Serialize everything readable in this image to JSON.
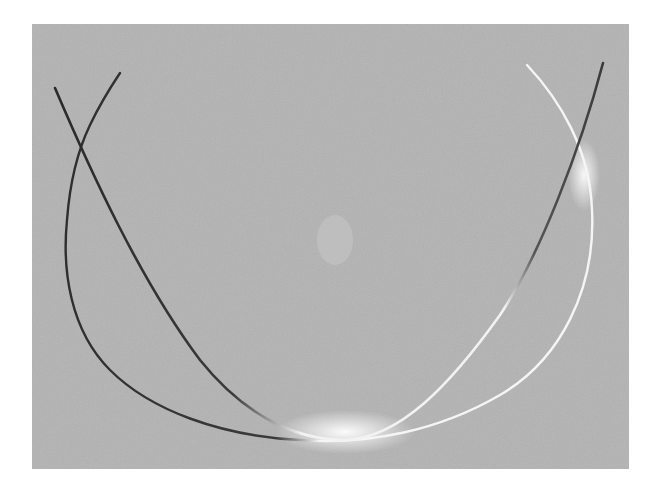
{
  "image": {
    "description": "Grayscale photograph of two crossing curved lines forming a U / elliptical arc pattern (diffraction-style lines), dark on upper left, bright where they meet near the bottom",
    "background_color": "#ffffff",
    "plate_color": "#b3b3b3",
    "dark_line_color": "#2e2e2e",
    "bright_line_color": "#f4f4f4",
    "curves": [
      {
        "name": "steep-curve",
        "points": [
          [
            55,
            88
          ],
          [
            80,
            148
          ],
          [
            150,
            290
          ],
          [
            230,
            390
          ],
          [
            300,
            430
          ],
          [
            350,
            440
          ],
          [
            420,
            410
          ],
          [
            500,
            320
          ],
          [
            560,
            200
          ],
          [
            603,
            63
          ]
        ]
      },
      {
        "name": "u-arc",
        "points": [
          [
            120,
            73
          ],
          [
            80,
            148
          ],
          [
            67,
            260
          ],
          [
            90,
            350
          ],
          [
            150,
            410
          ],
          [
            240,
            436
          ],
          [
            330,
            442
          ],
          [
            420,
            425
          ],
          [
            520,
            370
          ],
          [
            588,
            260
          ],
          [
            592,
            180
          ],
          [
            575,
            130
          ],
          [
            527,
            65
          ]
        ]
      }
    ]
  }
}
